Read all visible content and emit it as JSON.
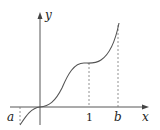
{
  "diagram": {
    "type": "function-graph",
    "axes": {
      "x_label": "x",
      "y_label": "y"
    },
    "tick_labels": {
      "a": "a",
      "one": "1",
      "b": "b"
    },
    "curve": {
      "description": "increasing curve through origin with horizontal inflection near x=0 and a plateau near x=1, rising steeply to x=b",
      "color": "#555555"
    },
    "dashed_guides": [
      "x=a",
      "x=1",
      "x=b"
    ]
  }
}
